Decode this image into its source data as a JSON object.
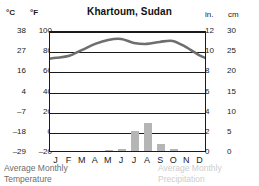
{
  "header": {
    "title": "Khartoum, Sudan",
    "left_unit_primary": "°C",
    "left_unit_secondary": "°F",
    "right_unit_primary": "in.",
    "right_unit_secondary": "cm"
  },
  "captions": {
    "temperature": "Average Monthly\nTemperature",
    "precipitation": "Average Monthly\nPrecipitation"
  },
  "colors": {
    "axis": "#1a1a1a",
    "curve": "#6e6e6e",
    "bar": "#b5b5b5",
    "caption_temp": "#6d6d6d",
    "caption_precip": "#cdcdcd",
    "background": "#ffffff"
  },
  "chart_data": {
    "type": "line",
    "title": "Khartoum, Sudan",
    "xlabel": "",
    "ylabel": "",
    "grid": true,
    "legend_position": "below",
    "categories": [
      "J",
      "F",
      "M",
      "A",
      "M",
      "J",
      "J",
      "A",
      "S",
      "O",
      "N",
      "D"
    ],
    "month_names": [
      "January",
      "February",
      "March",
      "April",
      "May",
      "June",
      "July",
      "August",
      "September",
      "October",
      "November",
      "December"
    ],
    "axes": {
      "left_celsius": {
        "label": "°C",
        "ticks": [
          38,
          27,
          16,
          4,
          -7,
          -18,
          -29
        ],
        "range": [
          -29,
          38
        ]
      },
      "left_fahrenheit": {
        "label": "°F",
        "ticks": [
          100,
          80,
          60,
          40,
          20,
          0,
          -20
        ],
        "range": [
          -20,
          100
        ]
      },
      "right_inches": {
        "label": "in.",
        "ticks": [
          12,
          10,
          8,
          6,
          4,
          2,
          0
        ],
        "range": [
          0,
          12
        ]
      },
      "right_centimeters": {
        "label": "cm",
        "ticks": [
          30,
          25,
          20,
          15,
          10,
          5,
          0
        ],
        "range": [
          0,
          30
        ]
      }
    },
    "series": [
      {
        "name": "Average Monthly Temperature",
        "type": "line",
        "unit": "°F",
        "axis": "left_fahrenheit",
        "values": [
          74,
          76,
          82,
          88,
          92,
          93,
          89,
          88,
          90,
          91,
          85,
          77
        ]
      },
      {
        "name": "Average Monthly Temperature",
        "type": "line",
        "unit": "°C",
        "axis": "left_celsius",
        "values": [
          23,
          24,
          28,
          31,
          33,
          34,
          32,
          31,
          32,
          33,
          29,
          25
        ]
      },
      {
        "name": "Average Monthly Precipitation",
        "type": "bar",
        "unit": "in.",
        "axis": "right_inches",
        "values": [
          0,
          0,
          0,
          0,
          0.15,
          0.2,
          2.0,
          2.75,
          0.7,
          0.2,
          0,
          0
        ]
      },
      {
        "name": "Average Monthly Precipitation",
        "type": "bar",
        "unit": "cm",
        "axis": "right_centimeters",
        "values": [
          0,
          0,
          0,
          0,
          0.4,
          0.5,
          5.0,
          6.9,
          1.8,
          0.5,
          0,
          0
        ]
      }
    ]
  }
}
